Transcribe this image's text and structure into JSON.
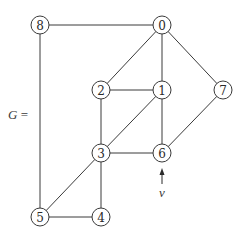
{
  "diagram": {
    "graph_label": "G =",
    "pointer_label": "v",
    "pointer_target": "6",
    "colors": {
      "stroke": "#3a3a3a",
      "node_fill": "#ffffff",
      "text": "#2a2a2a"
    },
    "node_radius": 9,
    "nodes": [
      {
        "id": "0",
        "label": "0",
        "x": 162,
        "y": 25
      },
      {
        "id": "1",
        "label": "1",
        "x": 162,
        "y": 90
      },
      {
        "id": "2",
        "label": "2",
        "x": 101,
        "y": 90
      },
      {
        "id": "3",
        "label": "3",
        "x": 101,
        "y": 153
      },
      {
        "id": "4",
        "label": "4",
        "x": 101,
        "y": 217
      },
      {
        "id": "5",
        "label": "5",
        "x": 40,
        "y": 217
      },
      {
        "id": "6",
        "label": "6",
        "x": 162,
        "y": 153
      },
      {
        "id": "7",
        "label": "7",
        "x": 223,
        "y": 90
      },
      {
        "id": "8",
        "label": "8",
        "x": 40,
        "y": 25
      }
    ],
    "edges": [
      [
        "8",
        "0"
      ],
      [
        "8",
        "5"
      ],
      [
        "0",
        "2"
      ],
      [
        "0",
        "1"
      ],
      [
        "0",
        "7"
      ],
      [
        "2",
        "1"
      ],
      [
        "2",
        "3"
      ],
      [
        "1",
        "3"
      ],
      [
        "1",
        "6"
      ],
      [
        "7",
        "6"
      ],
      [
        "3",
        "6"
      ],
      [
        "3",
        "5"
      ],
      [
        "3",
        "4"
      ],
      [
        "5",
        "4"
      ]
    ]
  }
}
